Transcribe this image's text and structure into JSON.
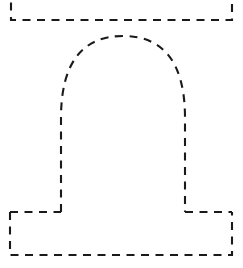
{
  "canvas": {
    "width": 243,
    "height": 268,
    "background_color": "#ffffff",
    "title": "Dashed bell outline tracing template"
  },
  "style": {
    "stroke_color": "#1a1a1a",
    "stroke_width": 2.1,
    "dash_length": 8,
    "gap_length": 6.5,
    "dash_array": "8 6.5",
    "line_cap": "butt",
    "fill": "none"
  },
  "shapes": {
    "top_panel": {
      "name": "top-rectangle-partial",
      "description": "Rectangle clipped by the top edge of the canvas; only left, right and bottom edges visible",
      "left_x": 11,
      "right_x": 232,
      "top_y": -12,
      "bottom_y": 20,
      "path": "M 11 -12 L 11 20 L 232 20 L 232 -12"
    },
    "dome": {
      "name": "bell-dome-arch",
      "description": "Rounded dome with two straight vertical legs descending to the base panel",
      "apex_x": 123,
      "apex_y": 36,
      "left_leg_x": 61,
      "right_leg_x": 185,
      "leg_bottom_y": 212,
      "shoulder_y": 118,
      "path": "M 61 212 L 61 118 C 61 62 83 36 123 36 C 163 36 185 62 185 118 L 185 212"
    },
    "base_panel": {
      "name": "base-rectangle",
      "description": "Flared base rectangle; top edge is broken where the two dome legs meet it",
      "left_x": 10,
      "right_x": 232,
      "top_y": 212,
      "bottom_y": 255,
      "left_top_segment_end_x": 61,
      "right_top_segment_start_x": 185,
      "path_left_top": "M 10 212 L 61 212",
      "path_right_top": "M 185 212 L 232 212",
      "path_outline": "M 10 212 L 10 255 L 232 255 L 232 212"
    }
  },
  "labels": {
    "figure_label": "",
    "caption": ""
  }
}
